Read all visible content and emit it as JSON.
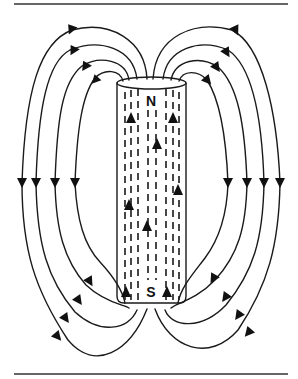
{
  "figure": {
    "labels": {
      "north_pole": "N",
      "south_pole": "S"
    },
    "colors": {
      "ink": "#1a1a1a",
      "background": "#ffffff"
    },
    "magnet": {
      "shape": "cylinder",
      "orientation": "vertical",
      "internal_field_direction": "up (S to N)"
    },
    "field_lines": {
      "left_side_count": 4,
      "right_side_count": 4,
      "external_direction": "N to S (downward on outside)"
    }
  }
}
